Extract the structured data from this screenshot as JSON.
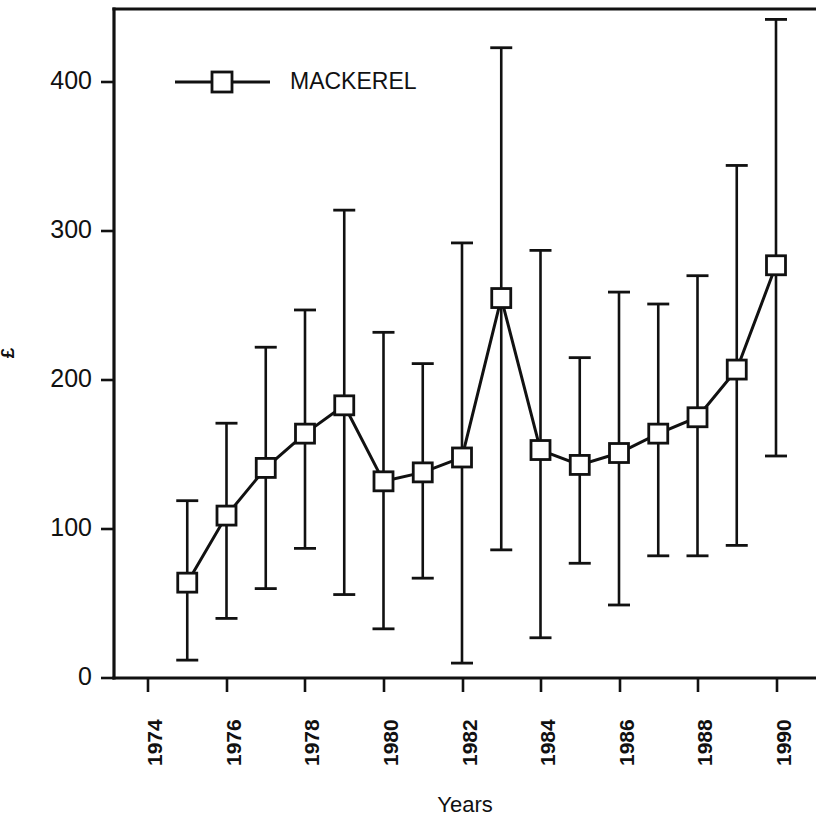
{
  "chart_data": {
    "type": "line",
    "title": "",
    "subtitle": "",
    "xlabel": "Years",
    "ylabel": "£",
    "legend": [
      {
        "label": "MACKEREL",
        "marker": "open-square",
        "color": "#111111"
      }
    ],
    "legend_position": "top-left-inside",
    "grid": false,
    "xlim": [
      1974,
      1991
    ],
    "ylim": [
      0,
      450
    ],
    "x_ticks": [
      1974,
      1976,
      1978,
      1980,
      1982,
      1984,
      1986,
      1988,
      1990
    ],
    "x_tick_labels": [
      "1974",
      "1976",
      "1978",
      "1980",
      "1982",
      "1984",
      "1986",
      "1988",
      "1990"
    ],
    "x_tick_label_rotation": 90,
    "y_ticks": [
      0,
      100,
      200,
      300,
      400
    ],
    "y_tick_labels": [
      "0",
      "100",
      "200",
      "300",
      "400"
    ],
    "series": [
      {
        "name": "MACKEREL",
        "x": [
          1975,
          1976,
          1977,
          1978,
          1979,
          1980,
          1981,
          1982,
          1983,
          1984,
          1985,
          1986,
          1987,
          1988,
          1989,
          1990
        ],
        "values": [
          64,
          109,
          141,
          164,
          183,
          132,
          138,
          148,
          255,
          153,
          143,
          151,
          164,
          175,
          207,
          277
        ],
        "error_low": [
          12,
          40,
          60,
          87,
          56,
          33,
          67,
          10,
          86,
          27,
          77,
          49,
          82,
          82,
          89,
          149
        ],
        "error_high": [
          119,
          171,
          222,
          247,
          314,
          232,
          211,
          292,
          423,
          287,
          215,
          259,
          251,
          270,
          344,
          442
        ]
      }
    ]
  },
  "figure": {
    "background_color": "#ffffff",
    "line_color": "#111111",
    "marker_fill": "#ffffff"
  }
}
